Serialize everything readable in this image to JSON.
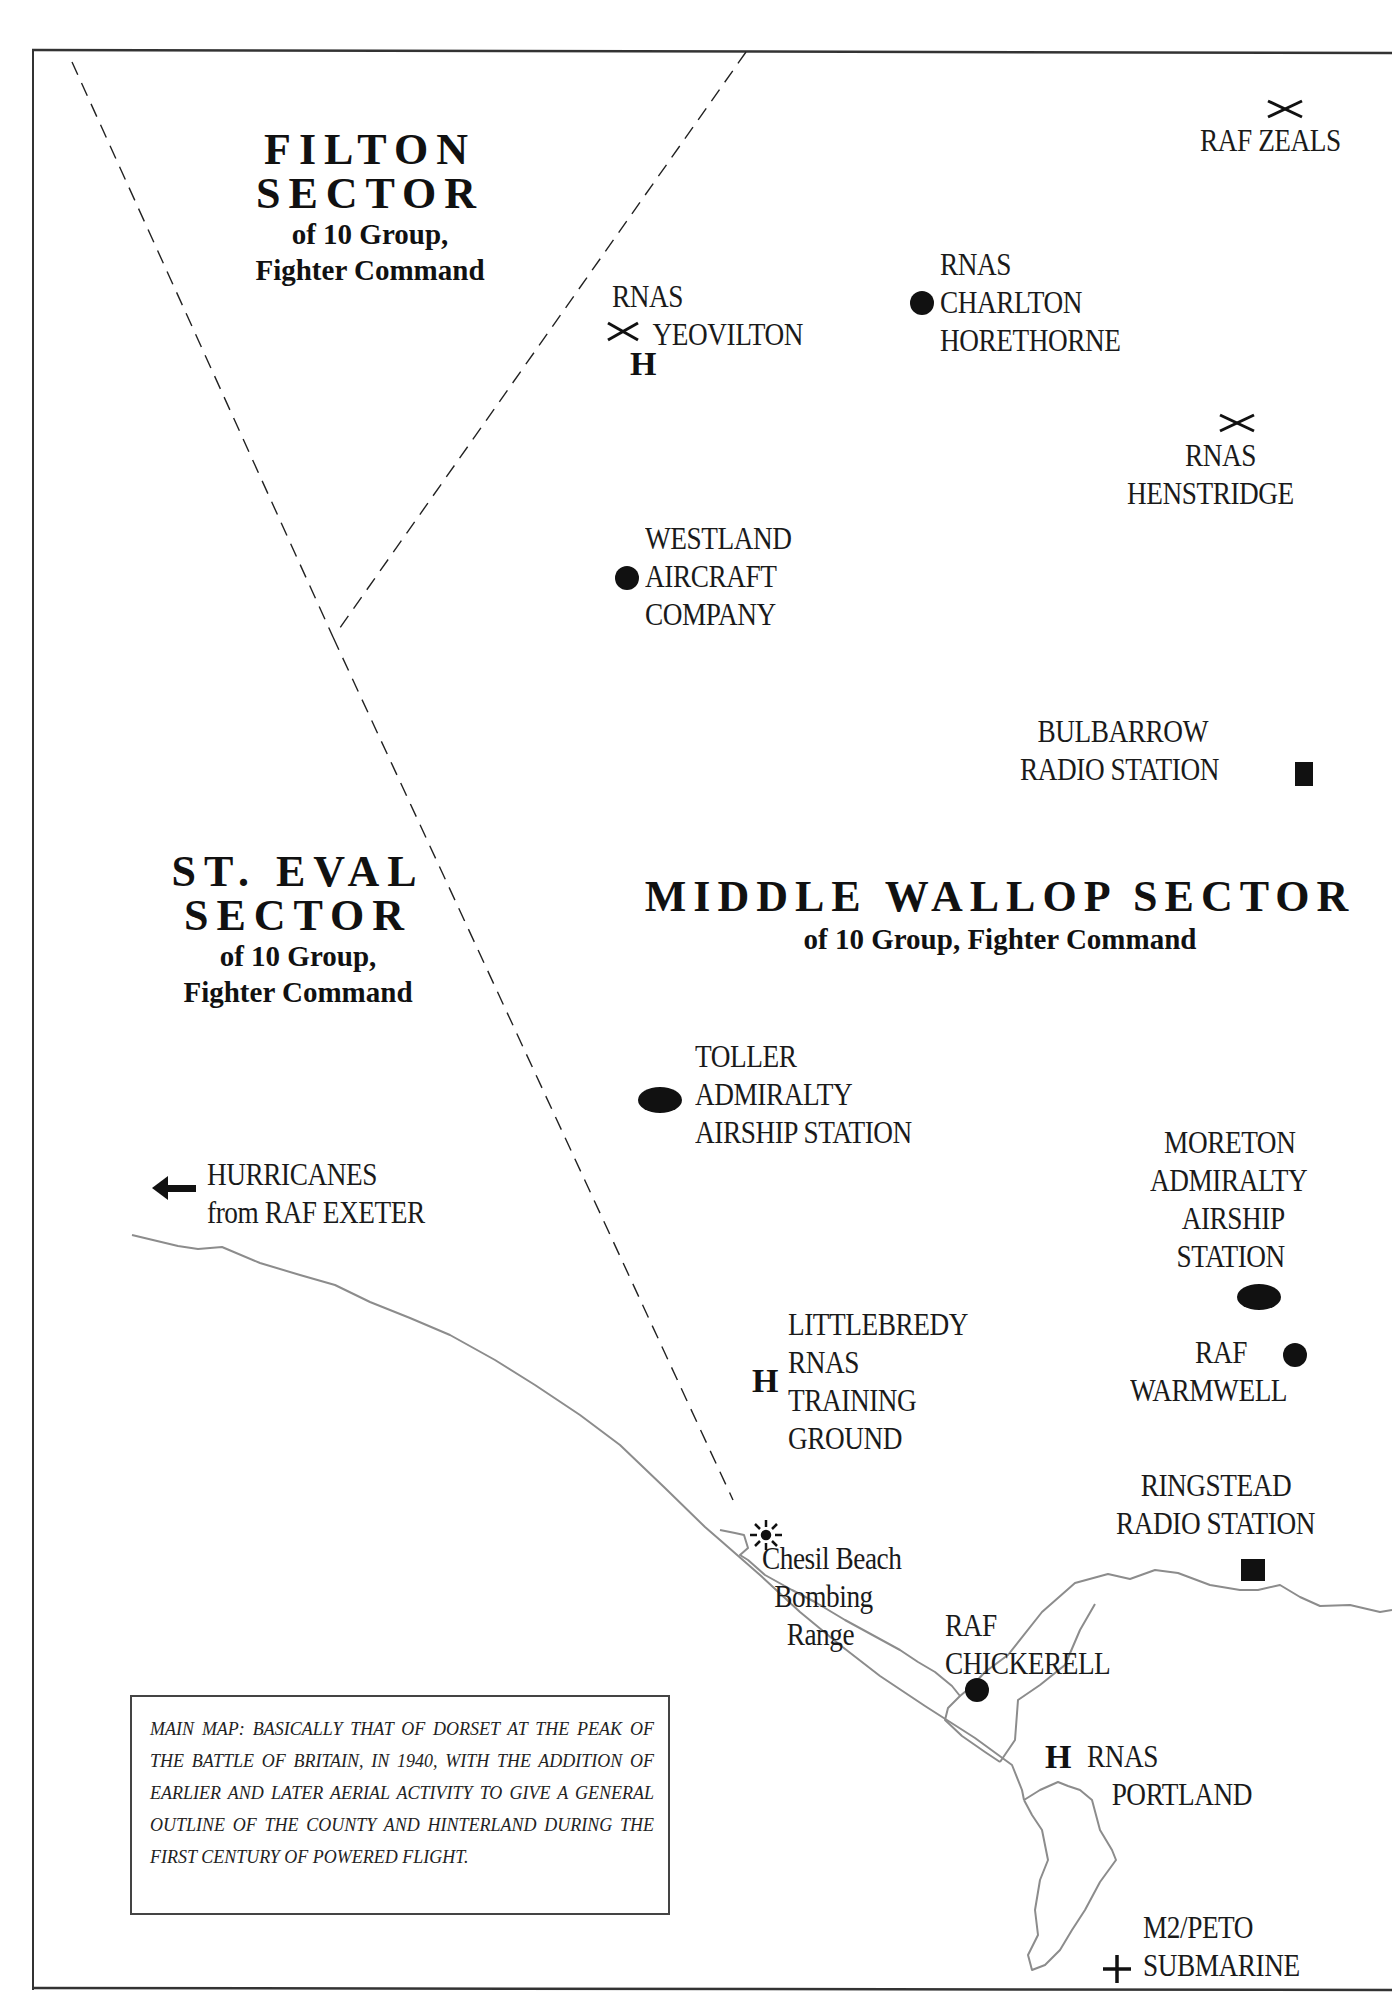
{
  "page_marker": "p",
  "sectors": {
    "filton": {
      "title_line1": "FILTON",
      "title_line2": "SECTOR",
      "sub_line1": "of 10 Group,",
      "sub_line2": "Fighter Command"
    },
    "st_eval": {
      "title_line1": "ST. EVAL",
      "title_line2": "SECTOR",
      "sub_line1": "of 10 Group,",
      "sub_line2": "Fighter Command"
    },
    "middle_wallop": {
      "title": "MIDDLE WALLOP SECTOR",
      "sub": "of 10 Group, Fighter Command"
    }
  },
  "places": {
    "raf_zeals": {
      "lines": [
        "RAF ZEALS"
      ],
      "symbol": "crossed-swords"
    },
    "rnas_yeovilton": {
      "lines": [
        "RNAS",
        "YEOVILTON"
      ],
      "symbol": "crossed-swords",
      "extra_symbol": "H"
    },
    "rnas_charlton_horethorne": {
      "lines": [
        "RNAS",
        "CHARLTON",
        "HORETHORNE"
      ],
      "symbol": "dot"
    },
    "rnas_henstridge": {
      "lines": [
        "RNAS",
        "HENSTRIDGE"
      ],
      "symbol": "crossed-swords"
    },
    "westland": {
      "lines": [
        "WESTLAND",
        "AIRCRAFT",
        "COMPANY"
      ],
      "symbol": "dot"
    },
    "bulbarrow": {
      "lines": [
        "BULBARROW",
        "RADIO STATION"
      ],
      "symbol": "square"
    },
    "toller": {
      "lines": [
        "TOLLER",
        "ADMIRALTY",
        "AIRSHIP STATION"
      ],
      "symbol": "ellipse"
    },
    "hurricanes": {
      "lines": [
        "HURRICANES",
        "from RAF EXETER"
      ],
      "symbol": "arrow-left"
    },
    "moreton": {
      "lines": [
        "MORETON",
        "ADMIRALTY",
        "AIRSHIP",
        "STATION"
      ],
      "symbol": "ellipse"
    },
    "raf_warmwell": {
      "lines": [
        "RAF",
        "WARMWELL"
      ],
      "symbol": "dot"
    },
    "littlebredy": {
      "lines": [
        "LITTLEBREDY",
        "RNAS",
        "TRAINING",
        "GROUND"
      ],
      "symbol": "H"
    },
    "ringstead": {
      "lines": [
        "RINGSTEAD",
        "RADIO STATION"
      ],
      "symbol": "square"
    },
    "chesil_beach": {
      "lines": [
        "Chesil Beach",
        "Bombing",
        "Range"
      ],
      "symbol": "starburst"
    },
    "raf_chickerell": {
      "lines": [
        "RAF",
        "CHICKERELL"
      ],
      "symbol": "dot"
    },
    "rnas_portland": {
      "lines": [
        "RNAS",
        "PORTLAND"
      ],
      "symbol": "H"
    },
    "m2_peto": {
      "lines": [
        "M2/PETO",
        "SUBMARINE"
      ],
      "symbol": "plus"
    }
  },
  "symbols": {
    "H": "H"
  },
  "note": {
    "text": "Main map: basically that of Dorset at the peak of the Battle of Britain, in 1940, with the addition of earlier and later aerial activity to give a general outline of the county and hinterland during the first century of powered flight."
  },
  "colors": {
    "ink": "#111111",
    "coastline": "#8c8c8c",
    "frame": "#333333",
    "background": "#ffffff"
  }
}
